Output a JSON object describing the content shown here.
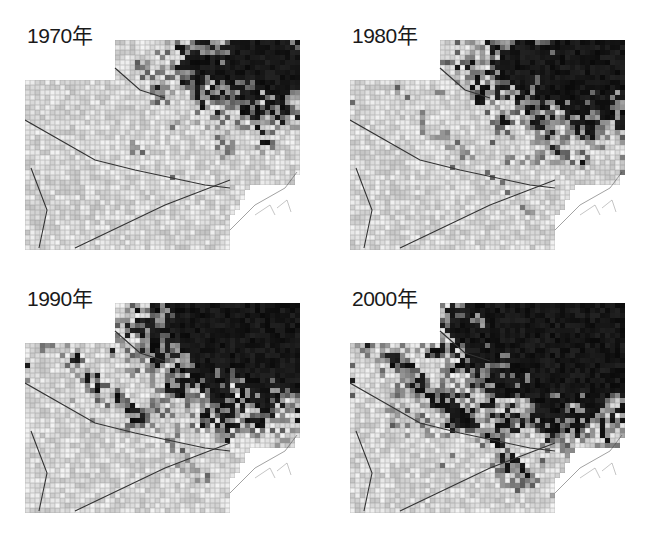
{
  "figure": {
    "type": "small-multiples grid map (grayscale raster)",
    "panels": [
      {
        "id": "p1970",
        "label": "1970年",
        "year": 1970,
        "x": 25,
        "y": 20,
        "density": 0.0
      },
      {
        "id": "p1980",
        "label": "1980年",
        "year": 1980,
        "x": 350,
        "y": 20,
        "density": 0.33
      },
      {
        "id": "p1990",
        "label": "1990年",
        "year": 1990,
        "x": 25,
        "y": 283,
        "density": 0.66
      },
      {
        "id": "p2000",
        "label": "2000年",
        "year": 2000,
        "x": 350,
        "y": 283,
        "density": 1.0
      }
    ],
    "colors": {
      "dark": "#0d0d0d",
      "light": "#f2f2f2",
      "water": "#ffffff",
      "line": "#2a2a2a"
    }
  }
}
